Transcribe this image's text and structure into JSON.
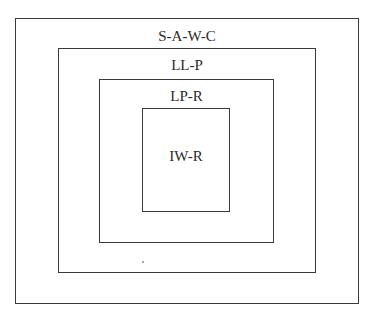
{
  "diagram": {
    "type": "nested-boxes",
    "layers": [
      {
        "id": "outer",
        "label": "S-A-W-C"
      },
      {
        "id": "second",
        "label": "LL-P"
      },
      {
        "id": "third",
        "label": "LP-R"
      },
      {
        "id": "inner",
        "label": "IW-R"
      }
    ],
    "colors": {
      "stroke": "#3a3a3a",
      "background": "#ffffff",
      "text": "#2a2a2a"
    }
  }
}
